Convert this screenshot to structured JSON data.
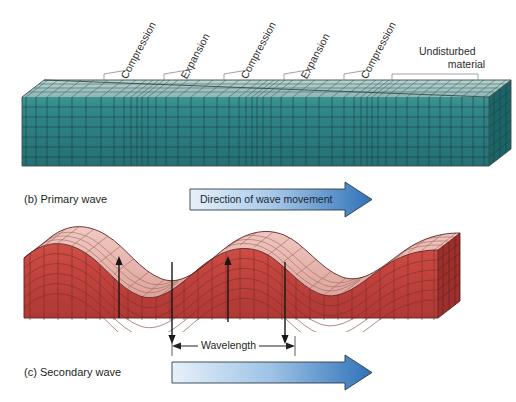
{
  "figure": {
    "title_hidden": "Seismic wave propagation diagram",
    "colors": {
      "primary_block_face": "#2d8083",
      "primary_block_top": "#9dc3c2",
      "primary_block_side": "#1f6366",
      "secondary_block_face": "#c4443f",
      "secondary_block_top": "#e9b3ab",
      "secondary_block_side": "#9c312e",
      "arrow_blue_light": "#dbe9f6",
      "arrow_blue_dark": "#2f72b8",
      "grid_line": "#2a2a2a",
      "leader_line": "#7a7a7a"
    }
  },
  "primary_wave": {
    "caption": "(b) Primary wave",
    "callouts": [
      {
        "label": "Compression",
        "x": 128
      },
      {
        "label": "Expansion",
        "x": 188
      },
      {
        "label": "Compression",
        "x": 248
      },
      {
        "label": "Expansion",
        "x": 308
      },
      {
        "label": "Compression",
        "x": 368
      }
    ],
    "undisturbed": {
      "line1": "Undisturbed",
      "line2": "material"
    },
    "arrow": {
      "label": "Direction of wave movement"
    }
  },
  "secondary_wave": {
    "caption": "(c) Secondary wave",
    "wavelength_label": "Wavelength",
    "arrow": {
      "label": ""
    },
    "shear_arrows": [
      {
        "direction": "up",
        "x": 119
      },
      {
        "direction": "down",
        "x": 172
      },
      {
        "direction": "up",
        "x": 228
      },
      {
        "direction": "down",
        "x": 285
      }
    ]
  }
}
